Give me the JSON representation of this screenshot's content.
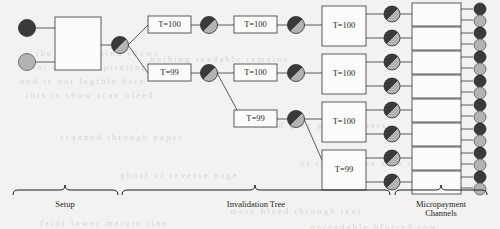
{
  "figure": {
    "background_color": "#f3f2f0",
    "ink_color": "#4a4a4a",
    "dark_fill": "#3a3a3a",
    "light_fill": "#b3b3b3"
  },
  "setup": {
    "party_a_label": "dark-key-circle",
    "party_b_label": "light-key-circle",
    "box_label": "",
    "output_node": "split-circle"
  },
  "tree": {
    "level1": [
      {
        "label": "T=100"
      },
      {
        "label": "T=99"
      }
    ],
    "level2": [
      {
        "label": "T=100"
      },
      {
        "label": "T=100"
      },
      {
        "label": "T=99"
      }
    ],
    "level3": [
      {
        "label": "T=100"
      },
      {
        "label": "T=100"
      },
      {
        "label": "T=100"
      },
      {
        "label": "T=99"
      }
    ]
  },
  "channels": [
    {
      "label": ""
    },
    {
      "label": ""
    },
    {
      "label": ""
    },
    {
      "label": ""
    },
    {
      "label": ""
    },
    {
      "label": ""
    },
    {
      "label": ""
    },
    {
      "label": ""
    }
  ],
  "braces": {
    "setup": "Setup",
    "invalidation_tree": "Invalidation Tree",
    "micropayment_line1": "Micropayment",
    "micropayment_line2": "Channels"
  },
  "bleed_text": [
    {
      "text": "the   page   behind   shows",
      "x": 36,
      "y": 48
    },
    {
      "text": "faint   reversed   printing",
      "x": 22,
      "y": 62
    },
    {
      "text": "and   is   not   legible   here",
      "x": 20,
      "y": 76
    },
    {
      "text": "this   is   show   scan   bleed",
      "x": 26,
      "y": 90
    },
    {
      "text": "nothing   readable   remains",
      "x": 150,
      "y": 54
    },
    {
      "text": "faded   grey   ghost   letters",
      "x": 255,
      "y": 120
    },
    {
      "text": "of   the   reverse   side   text",
      "x": 300,
      "y": 158
    },
    {
      "text": "scanned   through   paper",
      "x": 60,
      "y": 132
    },
    {
      "text": "ghost   of   reverse   page",
      "x": 120,
      "y": 170
    },
    {
      "text": "more   bleed   through   text",
      "x": 230,
      "y": 206
    },
    {
      "text": "faint   lower   margin   line",
      "x": 40,
      "y": 218
    },
    {
      "text": "unreadable   blurred   row",
      "x": 310,
      "y": 222
    }
  ]
}
